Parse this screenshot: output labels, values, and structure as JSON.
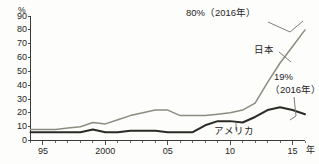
{
  "chart": {
    "y_unit_label": "%",
    "x_unit_label": "年",
    "y_ticks": [
      "0",
      "10",
      "20",
      "30",
      "40",
      "50",
      "60",
      "70",
      "80",
      "90"
    ],
    "x_ticks": [
      "95",
      "2000",
      "05",
      "10",
      "15"
    ]
  },
  "annotations": {
    "japan_peak": "80%（2016年）",
    "japan_series": "日本",
    "usa_value_line1": "19%",
    "usa_value_line2": "（2016年）",
    "usa_series": "アメリカ"
  },
  "chart_data": {
    "type": "line",
    "title": "",
    "xlabel": "年",
    "ylabel": "%",
    "xlim": [
      1994,
      2016
    ],
    "ylim": [
      0,
      90
    ],
    "grid": false,
    "legend": "inline-labels",
    "x": [
      1994,
      1995,
      1996,
      1997,
      1998,
      1999,
      2000,
      2001,
      2002,
      2003,
      2004,
      2005,
      2006,
      2007,
      2008,
      2009,
      2010,
      2011,
      2012,
      2013,
      2014,
      2015,
      2016
    ],
    "series": [
      {
        "name": "日本",
        "color": "#8d8b80",
        "end_label": "80%（2016年）",
        "values": [
          8,
          8,
          8,
          9,
          10,
          13,
          12,
          15,
          18,
          20,
          22,
          22,
          18,
          18,
          18,
          19,
          20,
          22,
          27,
          42,
          56,
          68,
          80
        ]
      },
      {
        "name": "アメリカ",
        "color": "#2b2b26",
        "end_label": "19%（2016年）",
        "values": [
          6,
          6,
          6,
          6,
          6,
          8,
          6,
          6,
          7,
          7,
          7,
          6,
          6,
          6,
          11,
          14,
          14,
          13,
          17,
          22,
          24,
          22,
          19
        ]
      }
    ]
  }
}
